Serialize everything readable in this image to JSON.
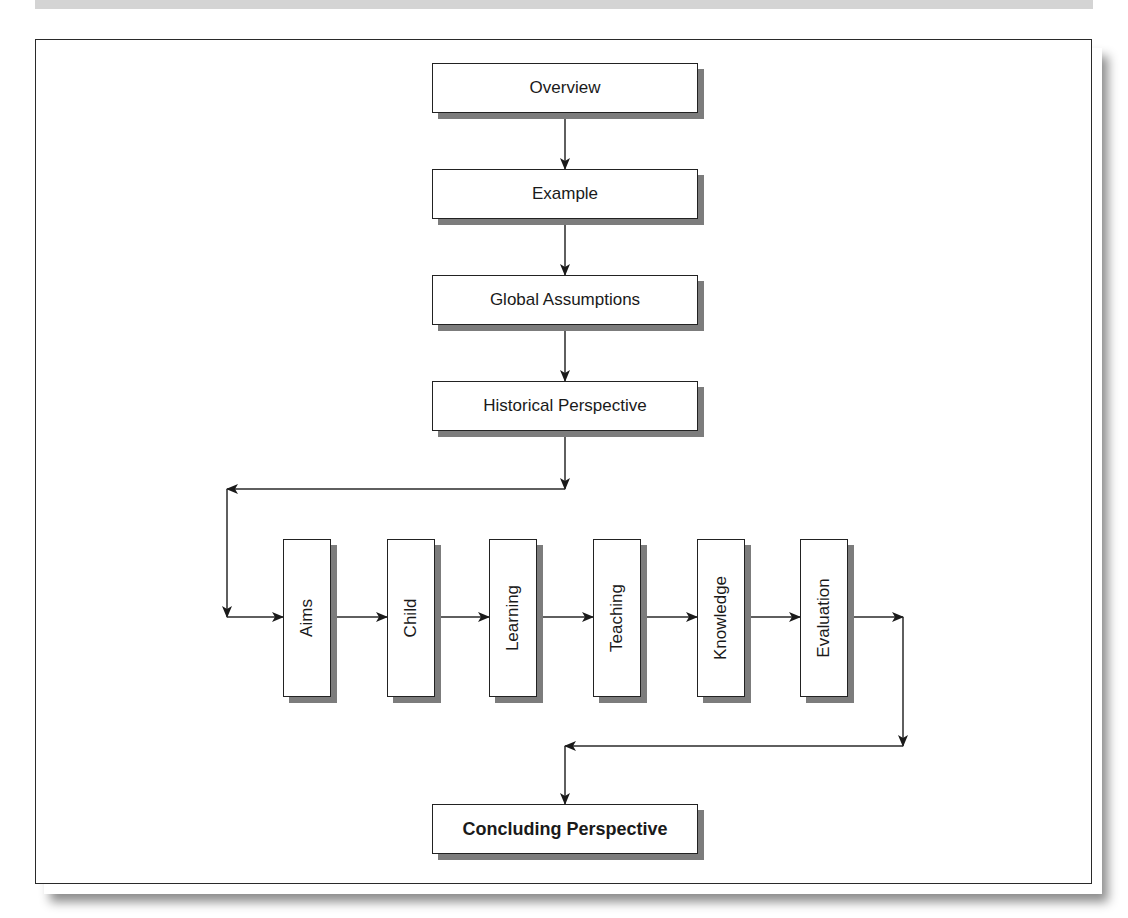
{
  "figure": {
    "caption_visible": false,
    "caption_band_color": "#d4d4d4",
    "frame_border_color": "#2a2a2a",
    "box_shadow_color": "#7c7c7c"
  },
  "flow": {
    "top_sequence": [
      {
        "id": "overview",
        "label": "Overview"
      },
      {
        "id": "example",
        "label": "Example"
      },
      {
        "id": "global-assumptions",
        "label": "Global Assumptions"
      },
      {
        "id": "historical-perspective",
        "label": "Historical Perspective"
      }
    ],
    "middle_sequence": [
      {
        "id": "aims",
        "label": "Aims"
      },
      {
        "id": "child",
        "label": "Child"
      },
      {
        "id": "learning",
        "label": "Learning"
      },
      {
        "id": "teaching",
        "label": "Teaching"
      },
      {
        "id": "knowledge",
        "label": "Knowledge"
      },
      {
        "id": "evaluation",
        "label": "Evaluation"
      }
    ],
    "final": {
      "id": "concluding-perspective",
      "label": "Concluding Perspective",
      "bold": true
    }
  }
}
